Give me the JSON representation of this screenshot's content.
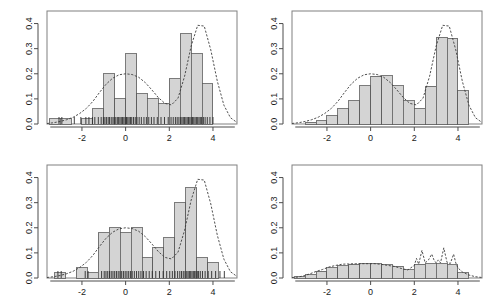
{
  "figure": {
    "title": "",
    "layout": "2x2 panel grid of histograms with overlaid kernel density estimates",
    "background": "#ffffff",
    "panel_count": 4
  },
  "style": {
    "bar_fill": "#d4d4d4",
    "bar_stroke": "#5a5a5a",
    "curve_color": "#3c3c3c",
    "axis_color": "#4d4d4d",
    "frame_color": "#808080",
    "rug_color": "#2b2b2b",
    "text_color": "#1a1a1a"
  },
  "axes": {
    "x_ticks": [
      -2,
      0,
      2,
      4
    ],
    "x_tick_labels": [
      "-2",
      "0",
      "2",
      "4"
    ],
    "y_ticks": [
      0.0,
      0.1,
      0.2,
      0.3,
      0.4
    ],
    "y_tick_labels": [
      "0.0",
      "0.1",
      "0.2",
      "0.3",
      "0.4"
    ],
    "xlim": [
      -3.6,
      5.1
    ],
    "ylim": [
      0.0,
      0.45
    ],
    "xlabel": "",
    "ylabel": ""
  },
  "chart_data": [
    {
      "id": "panel-top-left",
      "type": "bar",
      "title": "",
      "xlabel": "",
      "ylabel": "",
      "xlim": [
        -3.6,
        5.1
      ],
      "ylim": [
        0.0,
        0.45
      ],
      "grid": false,
      "legend": "none",
      "bin_width": 0.5,
      "bin_edges": [
        -3.5,
        -3.0,
        -2.5,
        -2.0,
        -1.5,
        -1.0,
        -0.5,
        0.0,
        0.5,
        1.0,
        1.5,
        2.0,
        2.5,
        3.0,
        3.5,
        4.0
      ],
      "values": [
        0.02,
        0.02,
        0.0,
        0.02,
        0.06,
        0.2,
        0.1,
        0.28,
        0.12,
        0.1,
        0.08,
        0.18,
        0.36,
        0.28,
        0.16
      ],
      "density_curve": {
        "label": "kernel density estimate",
        "bandwidth": "default",
        "x": [
          -3.6,
          -3.3,
          -3.0,
          -2.7,
          -2.4,
          -2.1,
          -1.8,
          -1.5,
          -1.2,
          -0.9,
          -0.6,
          -0.3,
          0.0,
          0.3,
          0.6,
          0.9,
          1.2,
          1.5,
          1.8,
          2.1,
          2.4,
          2.7,
          3.0,
          3.3,
          3.6,
          3.9,
          4.2,
          4.5,
          4.8,
          5.1
        ],
        "y": [
          0.002,
          0.005,
          0.01,
          0.017,
          0.027,
          0.042,
          0.062,
          0.09,
          0.125,
          0.158,
          0.182,
          0.196,
          0.2,
          0.197,
          0.186,
          0.165,
          0.136,
          0.105,
          0.082,
          0.076,
          0.103,
          0.19,
          0.31,
          0.393,
          0.39,
          0.295,
          0.17,
          0.075,
          0.025,
          0.006
        ]
      },
      "rug": {
        "shown": true,
        "values": [
          -3.05,
          -2.92,
          -2.35,
          -2.05,
          -1.82,
          -1.68,
          -1.52,
          -1.41,
          -1.25,
          -1.12,
          -1.02,
          -0.95,
          -0.88,
          -0.8,
          -0.74,
          -0.66,
          -0.58,
          -0.52,
          -0.45,
          -0.38,
          -0.32,
          -0.26,
          -0.2,
          -0.14,
          -0.08,
          -0.02,
          0.04,
          0.1,
          0.16,
          0.22,
          0.28,
          0.36,
          0.44,
          0.52,
          0.62,
          0.72,
          0.84,
          0.95,
          1.06,
          1.18,
          1.3,
          1.45,
          1.62,
          1.78,
          1.95,
          2.08,
          2.18,
          2.28,
          2.36,
          2.44,
          2.52,
          2.58,
          2.64,
          2.7,
          2.76,
          2.82,
          2.88,
          2.94,
          3.0,
          3.06,
          3.12,
          3.18,
          3.24,
          3.3,
          3.36,
          3.42,
          3.48,
          3.56,
          3.64,
          3.74,
          3.86,
          4.0
        ]
      }
    },
    {
      "id": "panel-top-right",
      "type": "bar",
      "title": "",
      "xlabel": "",
      "ylabel": "",
      "xlim": [
        -3.6,
        5.1
      ],
      "ylim": [
        0.0,
        0.45
      ],
      "grid": false,
      "legend": "none",
      "bin_width": 0.5,
      "bin_edges": [
        -3.0,
        -2.5,
        -2.0,
        -1.5,
        -1.0,
        -0.5,
        0.0,
        0.5,
        1.0,
        1.5,
        2.0,
        2.5,
        3.0,
        3.5,
        4.0,
        4.5
      ],
      "values": [
        0.006,
        0.013,
        0.033,
        0.061,
        0.092,
        0.152,
        0.19,
        0.192,
        0.152,
        0.092,
        0.061,
        0.15,
        0.345,
        0.342,
        0.133
      ],
      "density_curve": {
        "label": "kernel density estimate",
        "bandwidth": "moderate",
        "x": [
          -3.6,
          -3.3,
          -3.0,
          -2.7,
          -2.4,
          -2.1,
          -1.8,
          -1.5,
          -1.2,
          -0.9,
          -0.6,
          -0.3,
          0.0,
          0.3,
          0.6,
          0.9,
          1.2,
          1.5,
          1.8,
          2.1,
          2.4,
          2.7,
          3.0,
          3.3,
          3.6,
          3.9,
          4.2,
          4.5,
          4.8,
          5.1
        ],
        "y": [
          0.002,
          0.005,
          0.01,
          0.017,
          0.027,
          0.042,
          0.062,
          0.09,
          0.125,
          0.158,
          0.182,
          0.196,
          0.2,
          0.197,
          0.186,
          0.165,
          0.136,
          0.105,
          0.082,
          0.076,
          0.103,
          0.19,
          0.31,
          0.393,
          0.39,
          0.295,
          0.17,
          0.075,
          0.025,
          0.006
        ]
      },
      "rug": {
        "shown": false,
        "values": []
      }
    },
    {
      "id": "panel-bottom-left",
      "type": "bar",
      "title": "",
      "xlabel": "",
      "ylabel": "",
      "xlim": [
        -3.6,
        5.1
      ],
      "ylim": [
        0.0,
        0.45
      ],
      "grid": false,
      "legend": "none",
      "bin_width": 0.5,
      "bin_edges": [
        -3.25,
        -2.75,
        -2.25,
        -1.75,
        -1.25,
        -0.75,
        -0.25,
        0.25,
        0.75,
        1.25,
        1.75,
        2.25,
        2.75,
        3.25,
        3.75,
        4.25,
        4.75
      ],
      "values": [
        0.02,
        0.0,
        0.04,
        0.02,
        0.18,
        0.2,
        0.18,
        0.2,
        0.08,
        0.12,
        0.16,
        0.3,
        0.36,
        0.08,
        0.06,
        0.0
      ],
      "density_curve": {
        "label": "kernel density estimate",
        "bandwidth": "default",
        "x": [
          -3.6,
          -3.3,
          -3.0,
          -2.7,
          -2.4,
          -2.1,
          -1.8,
          -1.5,
          -1.2,
          -0.9,
          -0.6,
          -0.3,
          0.0,
          0.3,
          0.6,
          0.9,
          1.2,
          1.5,
          1.8,
          2.1,
          2.4,
          2.7,
          3.0,
          3.3,
          3.6,
          3.9,
          4.2,
          4.5,
          4.8,
          5.1
        ],
        "y": [
          0.002,
          0.005,
          0.01,
          0.017,
          0.027,
          0.042,
          0.062,
          0.09,
          0.125,
          0.158,
          0.182,
          0.196,
          0.2,
          0.197,
          0.186,
          0.165,
          0.136,
          0.105,
          0.082,
          0.076,
          0.103,
          0.19,
          0.31,
          0.393,
          0.39,
          0.295,
          0.17,
          0.075,
          0.025,
          0.006
        ]
      },
      "rug": {
        "shown": true,
        "values": [
          -3.1,
          -2.95,
          -1.85,
          -1.72,
          -1.1,
          -0.98,
          -0.9,
          -0.82,
          -0.74,
          -0.66,
          -0.58,
          -0.5,
          -0.42,
          -0.34,
          -0.26,
          -0.18,
          -0.1,
          -0.02,
          0.06,
          0.14,
          0.22,
          0.3,
          0.4,
          0.5,
          0.6,
          0.7,
          0.82,
          0.94,
          1.08,
          1.22,
          1.38,
          1.55,
          1.72,
          1.88,
          2.02,
          2.14,
          2.26,
          2.38,
          2.48,
          2.56,
          2.64,
          2.72,
          2.8,
          2.86,
          2.92,
          2.98,
          3.04,
          3.1,
          3.16,
          3.22,
          3.28,
          3.34,
          3.42,
          3.52,
          3.64,
          3.78,
          3.94,
          4.12,
          4.32,
          4.52
        ]
      }
    },
    {
      "id": "panel-bottom-right",
      "type": "bar",
      "title": "",
      "xlabel": "",
      "ylabel": "",
      "xlim": [
        -3.6,
        5.1
      ],
      "ylim": [
        0.0,
        0.45
      ],
      "grid": false,
      "legend": "none",
      "bin_width": 0.5,
      "bin_edges": [
        -3.5,
        -3.0,
        -2.5,
        -2.0,
        -1.5,
        -1.0,
        -0.5,
        0.0,
        0.5,
        1.0,
        1.5,
        2.0,
        2.5,
        3.0,
        3.5,
        4.0,
        4.5
      ],
      "values": [
        0.004,
        0.012,
        0.026,
        0.04,
        0.048,
        0.055,
        0.057,
        0.057,
        0.053,
        0.046,
        0.032,
        0.054,
        0.057,
        0.056,
        0.052,
        0.02
      ],
      "density_curve": {
        "label": "under-smoothed density estimate",
        "bandwidth": "very small",
        "x": [
          -3.6,
          -3.3,
          -3.0,
          -2.8,
          -2.5,
          -2.2,
          -1.9,
          -1.6,
          -1.3,
          -1.0,
          -0.7,
          -0.4,
          -0.1,
          0.2,
          0.5,
          0.8,
          1.1,
          1.4,
          1.7,
          2.0,
          2.1,
          2.2,
          2.35,
          2.5,
          2.65,
          2.8,
          2.9,
          3.0,
          3.1,
          3.2,
          3.35,
          3.5,
          3.65,
          3.8,
          3.9,
          4.0,
          4.2,
          4.5,
          4.8,
          5.1
        ],
        "y": [
          0.002,
          0.004,
          0.01,
          0.016,
          0.026,
          0.034,
          0.044,
          0.05,
          0.055,
          0.056,
          0.057,
          0.057,
          0.057,
          0.057,
          0.054,
          0.05,
          0.046,
          0.038,
          0.032,
          0.05,
          0.078,
          0.055,
          0.11,
          0.06,
          0.072,
          0.095,
          0.072,
          0.06,
          0.072,
          0.06,
          0.12,
          0.062,
          0.058,
          0.095,
          0.06,
          0.04,
          0.024,
          0.012,
          0.005,
          0.002
        ]
      },
      "rug": {
        "shown": false,
        "values": []
      }
    }
  ]
}
